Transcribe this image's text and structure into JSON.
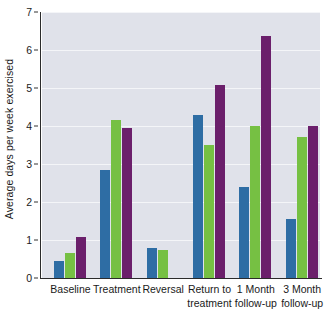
{
  "chart_data": {
    "type": "bar",
    "title": "",
    "xlabel": "",
    "ylabel": "Average days per week exercised",
    "ylim": [
      0,
      7
    ],
    "yticks": [
      0,
      1,
      2,
      3,
      4,
      5,
      6,
      7
    ],
    "grid": true,
    "legend": "none",
    "categories": [
      "Baseline",
      "Treatment",
      "Reversal",
      "Return to treatment",
      "1 Month follow-up",
      "3 Month follow-up"
    ],
    "category_lines": [
      [
        "Baseline",
        ""
      ],
      [
        "Treatment",
        ""
      ],
      [
        "Reversal",
        ""
      ],
      [
        "Return to",
        "treatment"
      ],
      [
        "1 Month",
        "follow-up"
      ],
      [
        "3 Month",
        "follow-up"
      ]
    ],
    "series": [
      {
        "name": "Participant 1",
        "color": "#2e6da4",
        "values": [
          0.45,
          2.85,
          0.8,
          4.3,
          2.4,
          1.55
        ]
      },
      {
        "name": "Participant 2",
        "color": "#76c043",
        "values": [
          0.65,
          4.17,
          0.75,
          3.5,
          4.0,
          3.7
        ]
      },
      {
        "name": "Participant 3",
        "color": "#6b1f6b",
        "values": [
          1.08,
          3.95,
          0,
          5.07,
          6.37,
          4.0
        ]
      }
    ],
    "colors": {
      "series_blue": "#2e6da4",
      "series_green": "#76c043",
      "series_purple": "#6b1f6b",
      "plot_background": "#e0e2ea",
      "gridline": "#f4f5f8",
      "axis": "#2b2b2b",
      "text": "#1a1a1a",
      "figure_background": "#ffffff"
    }
  }
}
